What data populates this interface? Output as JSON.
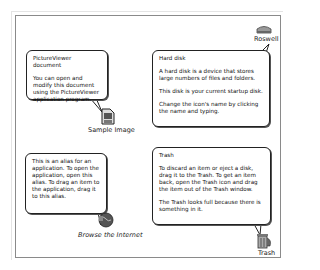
{
  "balloons": {
    "picture_viewer": {
      "title": "PictureViewer document",
      "body": "You can open and modify this document using the PictureViewer application program."
    },
    "hard_disk": {
      "title": "Hard disk",
      "paragraphs": [
        "A hard disk is a device that stores large numbers of files and folders.",
        "This disk is your current startup disk.",
        "Change the icon's name by clicking the name and typing."
      ]
    },
    "alias": {
      "body": "This is an alias for an application.  To open the application, open this alias.  To drag an item to the application, drag it to this alias."
    },
    "trash": {
      "title": "Trash",
      "paragraphs": [
        "To discard an item or eject a disk, drag it to the Trash.  To get an item back, open the Trash icon and drag the item out of the Trash window.",
        "The Trash looks full because there is something in it."
      ]
    }
  },
  "icons": {
    "sample_image": {
      "label": "Sample Image",
      "icon": "picture-document-icon"
    },
    "roswell": {
      "label": "Roswell",
      "icon": "hard-disk-icon"
    },
    "browse": {
      "label": "Browse the Internet",
      "icon": "globe-alias-icon"
    },
    "trash": {
      "label": "Trash",
      "icon": "trash-full-icon"
    }
  }
}
